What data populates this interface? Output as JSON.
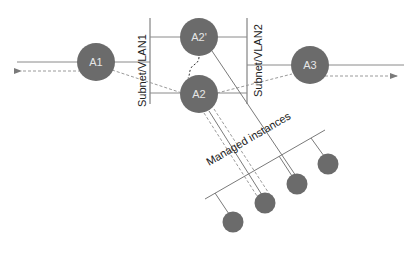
{
  "diagram": {
    "colors": {
      "node": "#6b6b6b",
      "line": "#7a7a7a",
      "dashed": "#9a9a9a",
      "text_dark": "#222222",
      "text_light": "#e6e6e6",
      "background": "#ffffff"
    },
    "nodes": {
      "a1": {
        "label": "A1"
      },
      "a2_prime": {
        "label": "A2'"
      },
      "a2": {
        "label": "A2"
      },
      "a3": {
        "label": "A3"
      }
    },
    "subnets": {
      "vlan1": {
        "label": "Subnet/VLAN1"
      },
      "vlan2": {
        "label": "Subnet/VLAN2"
      }
    },
    "managed_instances": {
      "label": "Managed instances",
      "count": 4
    }
  }
}
